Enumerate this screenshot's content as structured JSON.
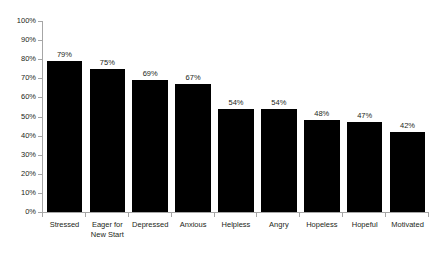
{
  "chart_data": {
    "type": "bar",
    "title": "",
    "xlabel": "",
    "ylabel": "",
    "categories": [
      "Stressed",
      "Eager for New Start",
      "Depressed",
      "Anxious",
      "Helpless",
      "Angry",
      "Hopeless",
      "Hopeful",
      "Motivated"
    ],
    "values": [
      79,
      75,
      69,
      67,
      54,
      54,
      48,
      47,
      42
    ],
    "data_labels": [
      "79%",
      "75%",
      "69%",
      "67%",
      "54%",
      "54%",
      "48%",
      "47%",
      "42%"
    ],
    "ylim": [
      0,
      100
    ],
    "ytick_labels": [
      "100%",
      "90%",
      "80%",
      "70%",
      "60%",
      "50%",
      "40%",
      "30%",
      "20%",
      "10%",
      "0%"
    ],
    "ytick_values": [
      100,
      90,
      80,
      70,
      60,
      50,
      40,
      30,
      20,
      10,
      0
    ],
    "grid": false,
    "legend": false,
    "bar_color": "#000000",
    "axis_color": "#a6a6a6",
    "text_color": "#231f20",
    "background_color": "#ffffff"
  }
}
